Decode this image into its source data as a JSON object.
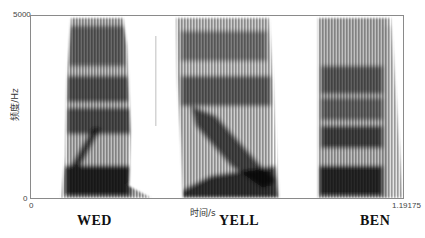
{
  "figure": {
    "type": "spectrogram",
    "y_axis": {
      "label": "频度/Hz",
      "ticks": [
        "5000",
        "0"
      ],
      "min": 0,
      "max": 5000
    },
    "x_axis": {
      "label": "时间/s",
      "ticks": [
        "0",
        "1.19175"
      ],
      "min": 0,
      "max": 1.19175
    },
    "words": [
      {
        "label": "WED",
        "start_px": 60,
        "end_px": 150
      },
      {
        "label": "YELL",
        "start_px": 175,
        "end_px": 282
      },
      {
        "label": "BEN",
        "start_px": 317,
        "end_px": 400
      }
    ],
    "colors": {
      "ink": "#111111",
      "frame": "#8a8a8a",
      "background": "#ffffff"
    }
  }
}
